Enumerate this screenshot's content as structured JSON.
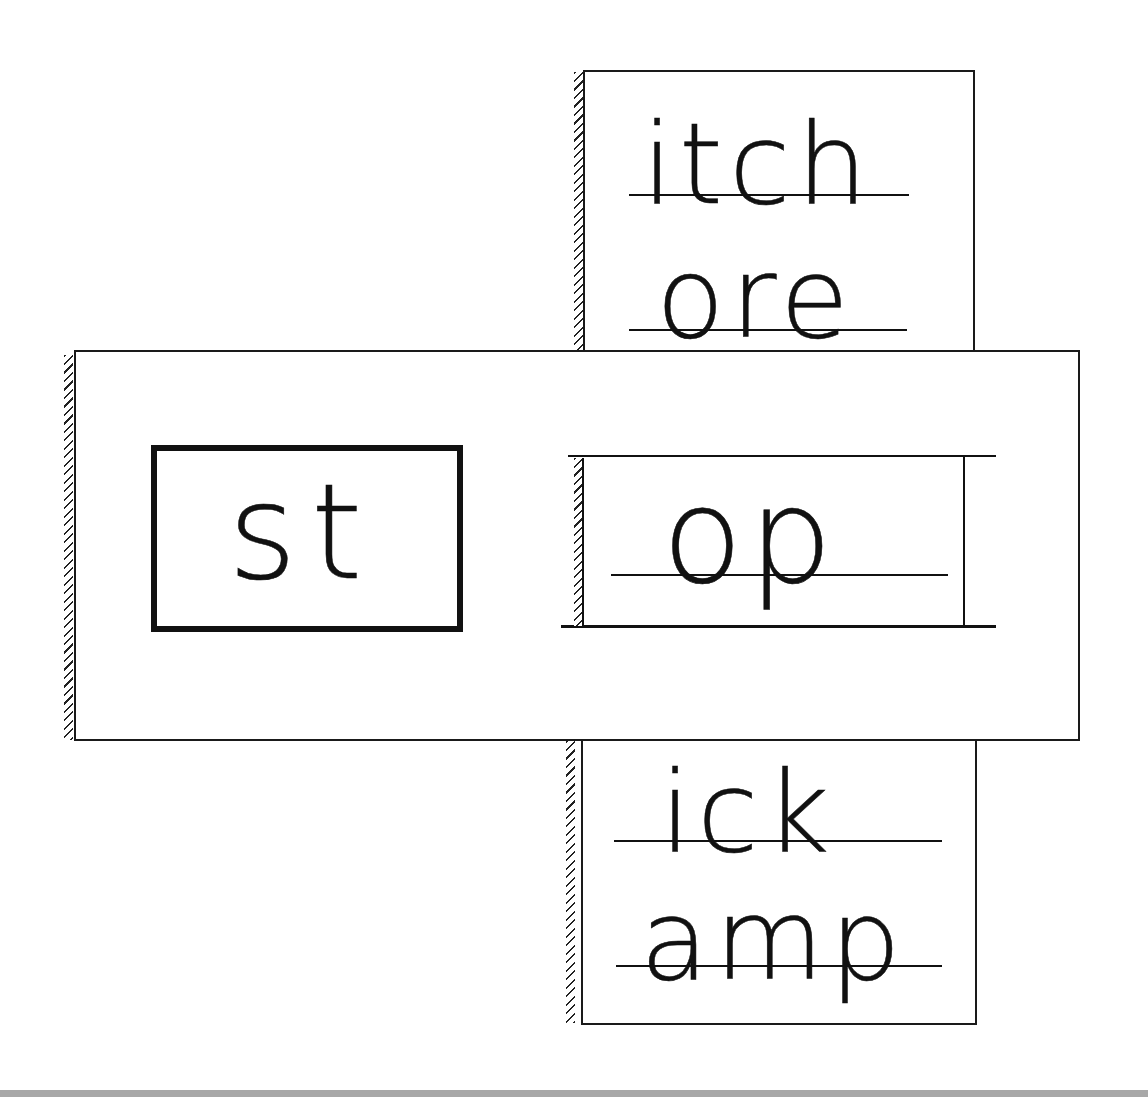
{
  "worksheet": {
    "type": "word-family slider",
    "prefix": {
      "text": "st"
    },
    "window_word": {
      "text": "op"
    },
    "strip_top": {
      "words": [
        "itch",
        "ore"
      ]
    },
    "strip_bottom": {
      "words": [
        "ick",
        "amp"
      ]
    }
  },
  "colors": {
    "ink": "#111111",
    "paper": "#ffffff",
    "bottom_band": "#a8a8a8"
  }
}
